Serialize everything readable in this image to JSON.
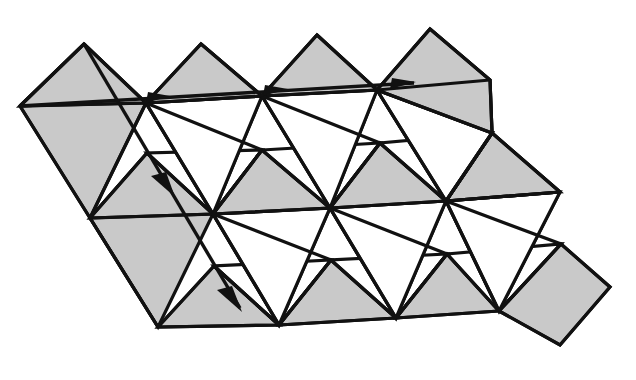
{
  "figure": {
    "background_color": "#ffffff",
    "tile_fill_shaded": "#c9c9c9",
    "tile_fill_blank": "#ffffff",
    "stroke_color": "#111111",
    "stroke_width": 3.2,
    "canvas": {
      "width": 636,
      "height": 380
    }
  },
  "geometry": {
    "origin_vertex": {
      "x": 146,
      "y": 103
    },
    "row1": {
      "baseline_y": 103,
      "apex_points": [
        {
          "x": 84,
          "y": 44
        },
        {
          "x": 201,
          "y": 44
        },
        {
          "x": 317,
          "y": 35
        },
        {
          "x": 430,
          "y": 29
        }
      ],
      "base_points": [
        {
          "x": 20,
          "y": 106
        },
        {
          "x": 146,
          "y": 103
        },
        {
          "x": 262,
          "y": 96
        },
        {
          "x": 377,
          "y": 90
        },
        {
          "x": 490,
          "y": 80
        }
      ]
    },
    "row2": {
      "apex_points": [
        {
          "x": 147,
          "y": 153
        },
        {
          "x": 262,
          "y": 150
        },
        {
          "x": 380,
          "y": 143
        },
        {
          "x": 492,
          "y": 133
        }
      ],
      "base_points": [
        {
          "x": 90,
          "y": 218
        },
        {
          "x": 213,
          "y": 214
        },
        {
          "x": 330,
          "y": 208
        },
        {
          "x": 446,
          "y": 201
        },
        {
          "x": 560,
          "y": 192
        }
      ]
    },
    "row3": {
      "apex_points": [
        {
          "x": 214,
          "y": 266
        },
        {
          "x": 331,
          "y": 260
        },
        {
          "x": 447,
          "y": 254
        },
        {
          "x": 561,
          "y": 244
        }
      ],
      "base_points": [
        {
          "x": 158,
          "y": 327
        },
        {
          "x": 279,
          "y": 325
        },
        {
          "x": 396,
          "y": 318
        },
        {
          "x": 499,
          "y": 311
        },
        {
          "x": 610,
          "y": 287
        }
      ]
    }
  },
  "vectors": [
    {
      "name": "translation-vector-horizontal",
      "label": "",
      "from": {
        "x": 20,
        "y": 106
      },
      "to": {
        "x": 414,
        "y": 83
      },
      "arrow_positions": [
        {
          "x": 163,
          "y": 98
        },
        {
          "x": 281,
          "y": 92
        },
        {
          "x": 409,
          "y": 84
        }
      ],
      "arrow_count": 3,
      "direction": "right-slightly-up"
    },
    {
      "name": "translation-vector-diagonal",
      "label": "",
      "from": {
        "x": 84,
        "y": 44
      },
      "to": {
        "x": 240,
        "y": 308
      },
      "arrow_positions": [
        {
          "x": 170,
          "y": 188
        },
        {
          "x": 238,
          "y": 306
        }
      ],
      "arrow_count": 2,
      "direction": "down-right"
    }
  ],
  "tiles": {
    "shaded_count": 13,
    "blank_count": 8,
    "shape_kinds": [
      "triangle",
      "quadrilateral-kite"
    ]
  }
}
